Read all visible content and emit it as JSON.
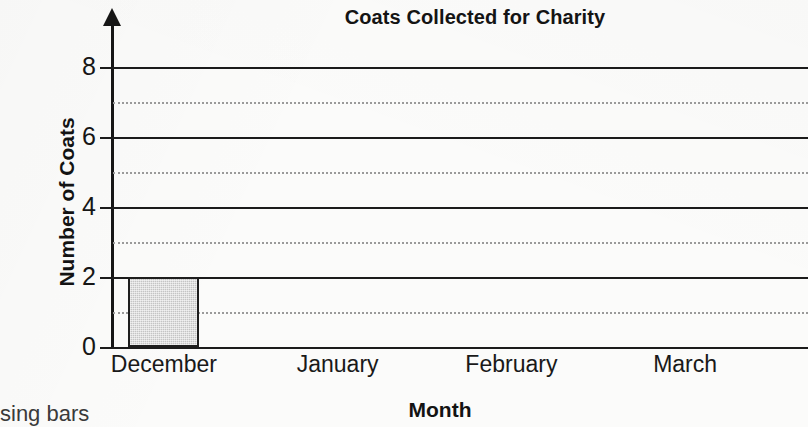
{
  "chart_data": {
    "type": "bar",
    "title": "Coats Collected for Charity",
    "xlabel": "Month",
    "ylabel": "Number of Coats",
    "categories": [
      "December",
      "January",
      "February",
      "March"
    ],
    "values": [
      2,
      null,
      null,
      null
    ],
    "ylim": [
      0,
      8
    ],
    "ytick_labels": [
      "0",
      "2",
      "4",
      "6",
      "8"
    ],
    "ytick_values": [
      0,
      2,
      4,
      6,
      8
    ],
    "grid": {
      "solid_values": [
        2,
        4,
        6,
        8
      ],
      "dotted_values": [
        1,
        3,
        5,
        7
      ],
      "position": "horizontal"
    },
    "legend": null,
    "bar_fill_color": "#c4c4c4",
    "bar_edge_color": "#1e1e1e",
    "axis_color": "#161616",
    "grid_solid_color": "#1b1b1b",
    "grid_dotted_color": "#9a9a9a",
    "background_color": "#fbfbfa"
  },
  "page": {
    "worksheet_fragment": "sing bars"
  }
}
